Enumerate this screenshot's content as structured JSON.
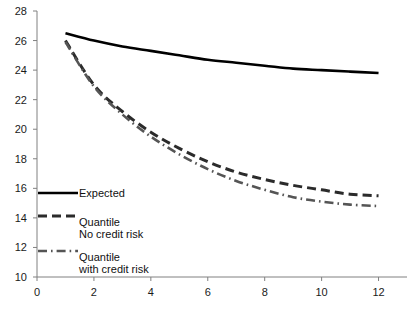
{
  "chart_data": {
    "type": "line",
    "title": "",
    "xlabel": "",
    "ylabel": "",
    "xlim": [
      0,
      13
    ],
    "ylim": [
      10,
      28
    ],
    "grid": false,
    "legend_position": "lower-left",
    "xticks": [
      0,
      2,
      4,
      6,
      8,
      10,
      12
    ],
    "yticks": [
      10,
      12,
      14,
      16,
      18,
      20,
      22,
      24,
      26,
      28
    ],
    "x": [
      1,
      2,
      3,
      4,
      5,
      6,
      7,
      8,
      9,
      10,
      11,
      12
    ],
    "series": [
      {
        "name": "Expected",
        "style": "solid",
        "color": "#000000",
        "values": [
          26.5,
          26.0,
          25.6,
          25.3,
          25.0,
          24.7,
          24.5,
          24.3,
          24.1,
          24.0,
          23.9,
          23.8
        ]
      },
      {
        "name": "Quantile No credit risk",
        "style": "dashed",
        "color": "#2b2b2b",
        "values": [
          26.0,
          23.0,
          21.2,
          19.8,
          18.7,
          17.8,
          17.1,
          16.6,
          16.2,
          15.9,
          15.6,
          15.5
        ]
      },
      {
        "name": "Quantile with credit risk",
        "style": "dash-dot",
        "color": "#555555",
        "values": [
          25.9,
          22.9,
          21.0,
          19.5,
          18.3,
          17.3,
          16.5,
          15.9,
          15.4,
          15.1,
          14.9,
          14.8
        ]
      }
    ]
  },
  "legend": {
    "items": [
      {
        "line1": "Expected",
        "line2": ""
      },
      {
        "line1": "Quantile",
        "line2": "No credit risk"
      },
      {
        "line1": "Quantile",
        "line2": "with credit risk"
      }
    ]
  },
  "axis": {
    "color": "#808080"
  }
}
